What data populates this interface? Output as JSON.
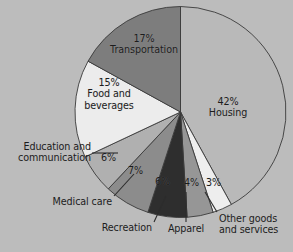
{
  "chart_data": {
    "type": "pie",
    "title": "",
    "subtitle": "",
    "xlabel": "",
    "ylabel": "",
    "legend_position": "none",
    "grid": false,
    "start_angle_deg": 0,
    "direction": "clockwise",
    "categories": [
      "Housing",
      "Other goods and services",
      "Apparel",
      "Recreation",
      "Medical care",
      "Education and communication",
      "Food and beverages",
      "Transportation"
    ],
    "values": [
      42,
      3,
      4,
      6,
      7,
      6,
      15,
      17
    ],
    "value_unit": "%",
    "slices": [
      {
        "label": "Housing",
        "label_line1": "42%",
        "label_line2": "Housing",
        "value": 42,
        "percent_text": "42%",
        "color": "#b9b9b9",
        "label_placement": "inside"
      },
      {
        "label": "Other goods and services",
        "label_line1": "Other goods",
        "label_line2": "and services",
        "value": 3,
        "percent_text": "3%",
        "color": "#eeeeee",
        "label_placement": "callout"
      },
      {
        "label": "Apparel",
        "label_line1": "Apparel",
        "label_line2": "",
        "value": 4,
        "percent_text": "4%",
        "color": "#969696",
        "label_placement": "callout"
      },
      {
        "label": "Recreation",
        "label_line1": "Recreation",
        "label_line2": "",
        "value": 6,
        "percent_text": "6%",
        "color": "#2e2e2e",
        "label_placement": "callout"
      },
      {
        "label": "Medical care",
        "label_line1": "Medical care",
        "label_line2": "",
        "value": 7,
        "percent_text": "7%",
        "color": "#8c8c8c",
        "label_placement": "callout"
      },
      {
        "label": "Education and communication",
        "label_line1": "Education and",
        "label_line2": "communication",
        "value": 6,
        "percent_text": "6%",
        "color": "#b0b0b0",
        "label_placement": "callout"
      },
      {
        "label": "Food and beverages",
        "label_line1": "15%",
        "label_line2": "Food and",
        "label_line3": "beverages",
        "value": 15,
        "percent_text": "15%",
        "color": "#ececec",
        "label_placement": "inside"
      },
      {
        "label": "Transportation",
        "label_line1": "17%",
        "label_line2": "Transportation",
        "value": 17,
        "percent_text": "17%",
        "color": "#7d7d7d",
        "label_placement": "inside"
      }
    ],
    "background_color": "#bcbcbc",
    "outline_color": "#3a3a3a",
    "text_color": "#1c1c1c"
  },
  "labels": {
    "housing_pct": "42%",
    "housing_name": "Housing",
    "transportation_pct": "17%",
    "transportation_name": "Transportation",
    "food_pct": "15%",
    "food_name_line1": "Food and",
    "food_name_line2": "beverages",
    "education_line1": "Education and",
    "education_line2": "communication",
    "education_pct": "6%",
    "medical_name": "Medical care",
    "medical_pct": "7%",
    "recreation_name": "Recreation",
    "recreation_pct": "6%",
    "apparel_name": "Apparel",
    "apparel_pct": "4%",
    "othergoods_line1": "Other goods",
    "othergoods_line2": "and services",
    "othergoods_pct": "3%"
  }
}
